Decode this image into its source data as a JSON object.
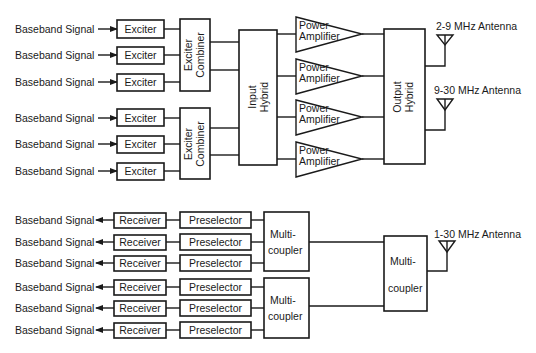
{
  "diagram": {
    "title": "",
    "transmit": {
      "inputs": [
        "Baseband Signal",
        "Baseband Signal",
        "Baseband Signal",
        "Baseband Signal",
        "Baseband Signal",
        "Baseband Signal"
      ],
      "exciters": [
        "Exciter",
        "Exciter",
        "Exciter",
        "Exciter",
        "Exciter",
        "Exciter"
      ],
      "combiners": [
        {
          "line1": "Exciter",
          "line2": "Combiner"
        },
        {
          "line1": "Exciter",
          "line2": "Combiner"
        }
      ],
      "input_hybrid": {
        "line1": "Input",
        "line2": "Hybrid"
      },
      "amplifiers": [
        {
          "line1": "Power",
          "line2": "Amplifier"
        },
        {
          "line1": "Power",
          "line2": "Amplifier"
        },
        {
          "line1": "Power",
          "line2": "Amplifier"
        },
        {
          "line1": "Power",
          "line2": "Amplifier"
        }
      ],
      "output_hybrid": {
        "line1": "Output",
        "line2": "Hybrid"
      },
      "antennas": [
        "2-9 MHz Antenna",
        "9-30 MHz Antenna"
      ]
    },
    "receive": {
      "outputs": [
        "Baseband Signal",
        "Baseband Signal",
        "Baseband Signal",
        "Baseband Signal",
        "Baseband Signal",
        "Baseband Signal"
      ],
      "receivers": [
        "Receiver",
        "Receiver",
        "Receiver",
        "Receiver",
        "Receiver",
        "Receiver"
      ],
      "preselectors": [
        "Preselector",
        "Preselector",
        "Preselector",
        "Preselector",
        "Preselector",
        "Preselector"
      ],
      "multicouplers": [
        {
          "line1": "Multi-",
          "line2": "coupler"
        },
        {
          "line1": "Multi-",
          "line2": "coupler"
        }
      ],
      "main_multicoupler": {
        "line1": "Multi-",
        "line2": "coupler"
      },
      "antenna": "1-30 MHz Antenna"
    },
    "colors": {
      "line": "#1a1a1a",
      "background": "#ffffff"
    }
  }
}
